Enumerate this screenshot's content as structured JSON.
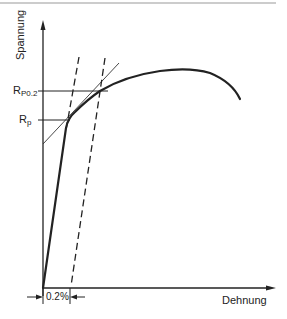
{
  "diagram": {
    "y_axis_label": "Spannung",
    "x_axis_label": "Dehnung",
    "labels": {
      "rp02_main": "R",
      "rp02_sub": "P0.2",
      "rp_main": "R",
      "rp_sub": "p"
    },
    "offset_dimension": "0.2%",
    "colors": {
      "line": "#222222",
      "thin_line": "#333333",
      "frame": "#999999"
    }
  }
}
